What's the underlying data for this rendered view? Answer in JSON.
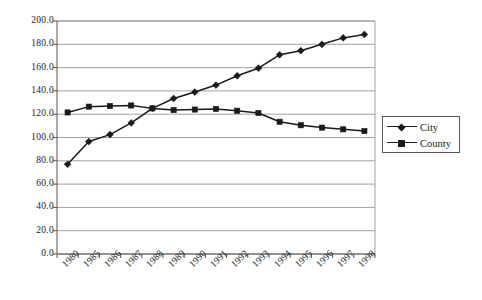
{
  "chart_data": {
    "type": "line",
    "title": "",
    "subtitle": "",
    "xlabel": "",
    "ylabel": "",
    "categories": [
      "1980",
      "1985",
      "1986",
      "1987",
      "1988",
      "1989",
      "1990",
      "1991",
      "1992",
      "1993",
      "1994",
      "1995",
      "1996",
      "1997",
      "1998"
    ],
    "series": [
      {
        "name": "City",
        "marker": "diamond",
        "color": "#1a1a1a",
        "values": [
          77.0,
          96.5,
          102.5,
          112.5,
          125.0,
          133.5,
          139.0,
          145.0,
          153.0,
          159.5,
          171.0,
          174.5,
          180.0,
          185.5,
          188.5
        ]
      },
      {
        "name": "County",
        "marker": "square",
        "color": "#1a1a1a",
        "values": [
          121.5,
          126.5,
          127.0,
          127.5,
          125.0,
          123.5,
          124.0,
          124.5,
          123.0,
          121.0,
          113.5,
          110.5,
          108.5,
          107.0,
          105.5
        ]
      }
    ],
    "ylim": [
      0,
      200
    ],
    "ytick_step": 20,
    "ytick_labels": [
      "200.0",
      "180.0",
      "160.0",
      "140.0",
      "120.0",
      "100.0",
      "80.0",
      "60.0",
      "40.0",
      "20.0",
      "0.0"
    ],
    "grid": {
      "horizontal": true,
      "vertical": false
    },
    "legend": {
      "position": "right",
      "entries": [
        "City",
        "County"
      ]
    },
    "axis_color": "#555555",
    "grid_color": "#8a8a8a",
    "plot_background": "#ffffff"
  }
}
